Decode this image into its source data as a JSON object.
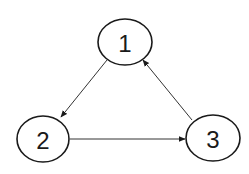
{
  "diagram": {
    "type": "directed-graph",
    "nodes": [
      {
        "id": "1",
        "label": "1",
        "cx": 125,
        "cy": 42,
        "rx": 27,
        "ry": 23
      },
      {
        "id": "2",
        "label": "2",
        "cx": 43,
        "cy": 139,
        "rx": 26,
        "ry": 23
      },
      {
        "id": "3",
        "label": "3",
        "cx": 213,
        "cy": 138,
        "rx": 27,
        "ry": 23
      }
    ],
    "edges": [
      {
        "from": "1",
        "to": "2"
      },
      {
        "from": "2",
        "to": "3"
      },
      {
        "from": "3",
        "to": "1"
      }
    ]
  }
}
